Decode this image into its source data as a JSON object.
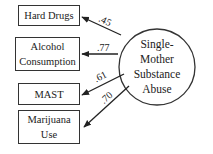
{
  "latent": {
    "lines": [
      "Single-",
      "Mother",
      "Substance",
      "Abuse"
    ]
  },
  "indicators": [
    {
      "label": "Hard Drugs",
      "loading": ".45"
    },
    {
      "label_lines": [
        "Alcohol",
        "Consumption"
      ],
      "loading": ".77"
    },
    {
      "label": "MAST",
      "loading": ".61"
    },
    {
      "label_lines": [
        "Marijuana",
        "Use"
      ],
      "loading": ".70"
    }
  ]
}
